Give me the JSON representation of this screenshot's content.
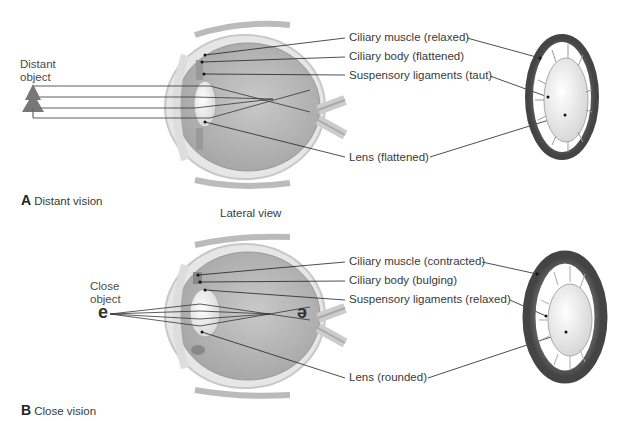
{
  "panel_a": {
    "caption_letter": "A",
    "caption_text": "Distant vision",
    "object_label_line1": "Distant",
    "object_label_line2": "object",
    "labels": [
      "Ciliary muscle (relaxed)",
      "Ciliary body (flattened)",
      "Suspensory ligaments (taut)",
      "Lens (flattened)"
    ]
  },
  "view_label": "Lateral view",
  "panel_b": {
    "caption_letter": "B",
    "caption_text": "Close vision",
    "object_label_line1": "Close",
    "object_label_line2": "object",
    "object_letter": "e",
    "image_letter": "e",
    "labels": [
      "Ciliary muscle (contracted)",
      "Ciliary body (bulging)",
      "Suspensory ligaments (relaxed)",
      "Lens (rounded)"
    ]
  }
}
